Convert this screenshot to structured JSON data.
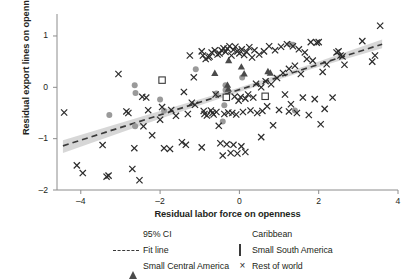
{
  "chart_data": {
    "type": "scatter",
    "title": "",
    "xlabel": "Residual labor force on openness",
    "ylabel": "Residual export lines on openness",
    "xlim": [
      -4.6,
      4.0
    ],
    "ylim": [
      -2.0,
      1.35
    ],
    "xticks": [
      -4,
      -2,
      0,
      2,
      4
    ],
    "xtick_labels": [
      "–4",
      "–2",
      "0",
      "2",
      "4"
    ],
    "yticks": [
      1,
      0,
      -1,
      -2
    ],
    "ytick_labels": [
      "1",
      "0",
      "–1",
      "–2"
    ],
    "grid": false,
    "legend_position": "below",
    "legend": [
      {
        "key": "ci",
        "label": "95% CI",
        "marker": "shaded-band",
        "color": "#c9c9c9"
      },
      {
        "key": "caribbean",
        "label": "Caribbean",
        "marker": "filled-circle",
        "color": "#9a9a9a"
      },
      {
        "key": "fit",
        "label": "Fit line",
        "marker": "dashed-line",
        "color": "#3a3a3a"
      },
      {
        "key": "small_south_america",
        "label": "Small South America",
        "marker": "open-square",
        "color": "#3a3a3a"
      },
      {
        "key": "small_central_america",
        "label": "Small Central America",
        "marker": "filled-triangle",
        "color": "#4a4a4a"
      },
      {
        "key": "rest_of_world",
        "label": "Rest of world",
        "marker": "cross-x",
        "color": "#2b2b2b"
      }
    ],
    "fit_line": {
      "name": "Fit line",
      "style": "dashed",
      "color": "#3a3a3a",
      "slope": 0.2455,
      "intercept": -0.0455,
      "x_start": -4.45,
      "x_end": 3.6,
      "y_start": -1.14,
      "y_end": 0.84
    },
    "confidence_band": {
      "name": "95% CI",
      "level": 0.95,
      "color": "#c9c9c9",
      "upper": [
        [
          -4.45,
          -1.03
        ],
        [
          -2.0,
          -0.46
        ],
        [
          0.0,
          -0.005
        ],
        [
          1.8,
          0.45
        ],
        [
          3.6,
          0.93
        ]
      ],
      "lower": [
        [
          -4.45,
          -1.28
        ],
        [
          -2.0,
          -0.61
        ],
        [
          0.0,
          -0.09
        ],
        [
          1.8,
          0.35
        ],
        [
          3.6,
          0.76
        ]
      ]
    },
    "series": [
      {
        "name": "Caribbean",
        "marker": "filled-circle",
        "color": "#9a9a9a",
        "points": [
          [
            -3.28,
            -0.54
          ],
          [
            -2.64,
            0.04
          ],
          [
            -2.62,
            -0.11
          ],
          [
            -2.63,
            -0.76
          ],
          [
            -2.0,
            -0.235
          ],
          [
            -1.9,
            -0.455
          ],
          [
            -1.1,
            0.35
          ],
          [
            -0.58,
            -0.12
          ],
          [
            -0.35,
            0.04
          ],
          [
            -0.35,
            -0.05
          ],
          [
            -0.38,
            -0.35
          ],
          [
            -0.42,
            -0.665
          ],
          [
            0.07,
            0.19
          ],
          [
            1.27,
            0.84
          ],
          [
            1.35,
            0.83
          ],
          [
            1.4,
            -0.45
          ]
        ]
      },
      {
        "name": "Small South America",
        "marker": "open-square",
        "color": "#3a3a3a",
        "points": [
          [
            -1.95,
            0.14
          ],
          [
            -0.33,
            -0.195
          ],
          [
            0.65,
            -0.175
          ]
        ]
      },
      {
        "name": "Small Central America",
        "marker": "filled-triangle",
        "color": "#4a4a4a",
        "points": [
          [
            -0.62,
            0.275
          ],
          [
            -0.27,
            0.525
          ],
          [
            -0.3,
            0.045
          ],
          [
            -0.28,
            -0.03
          ],
          [
            0.05,
            0.4
          ],
          [
            0.12,
            0.265
          ],
          [
            0.72,
            0.31
          ],
          [
            0.78,
            0.28
          ]
        ]
      },
      {
        "name": "Rest of world",
        "marker": "cross-x",
        "color": "#2b2b2b",
        "points": [
          [
            -4.42,
            -0.49
          ],
          [
            -4.1,
            -1.52
          ],
          [
            -3.95,
            -1.67
          ],
          [
            -3.45,
            -1.125
          ],
          [
            -3.35,
            -1.74
          ],
          [
            -3.3,
            -1.72
          ],
          [
            -3.05,
            0.26
          ],
          [
            -2.85,
            -0.47
          ],
          [
            -2.8,
            -0.5
          ],
          [
            -2.7,
            -1.59
          ],
          [
            -2.65,
            -1.185
          ],
          [
            -2.52,
            -1.81
          ],
          [
            -2.45,
            -0.185
          ],
          [
            -2.42,
            -0.76
          ],
          [
            -2.3,
            -0.445
          ],
          [
            -2.2,
            -0.935
          ],
          [
            -1.95,
            -0.385
          ],
          [
            -1.9,
            -1.185
          ],
          [
            -1.75,
            -1.2
          ],
          [
            -1.72,
            -0.44
          ],
          [
            -1.6,
            -0.555
          ],
          [
            -1.45,
            -1.07
          ],
          [
            -1.4,
            -0.09
          ],
          [
            -1.35,
            -1.12
          ],
          [
            -1.25,
            0.62
          ],
          [
            -1.2,
            -0.3
          ],
          [
            -1.15,
            0.195
          ],
          [
            -1.12,
            -0.34
          ],
          [
            -0.95,
            0.7
          ],
          [
            -0.92,
            0.62
          ],
          [
            -0.9,
            -0.46
          ],
          [
            -0.88,
            -0.52
          ],
          [
            -0.85,
            0.55
          ],
          [
            -0.82,
            -0.55
          ],
          [
            -0.78,
            0.58
          ],
          [
            -0.75,
            0.6
          ],
          [
            -0.72,
            -0.45
          ],
          [
            -0.7,
            0.68
          ],
          [
            -0.68,
            -0.5
          ],
          [
            -0.65,
            -0.53
          ],
          [
            -0.62,
            0.72
          ],
          [
            -0.6,
            -0.14
          ],
          [
            -0.58,
            -0.48
          ],
          [
            -0.55,
            0.64
          ],
          [
            -0.52,
            -0.75
          ],
          [
            -0.5,
            0.66
          ],
          [
            -0.48,
            -1.09
          ],
          [
            -0.45,
            0.72
          ],
          [
            -0.42,
            -1.33
          ],
          [
            -0.4,
            0.76
          ],
          [
            -0.38,
            -0.52
          ],
          [
            -0.35,
            0.69
          ],
          [
            -0.32,
            -1.11
          ],
          [
            -0.3,
            0.75
          ],
          [
            -0.28,
            -0.49
          ],
          [
            -0.25,
            0.8
          ],
          [
            -0.22,
            -1.28
          ],
          [
            -0.2,
            0.62
          ],
          [
            -0.18,
            -0.5
          ],
          [
            -0.15,
            0.73
          ],
          [
            -0.12,
            -0.18
          ],
          [
            -0.1,
            0.79
          ],
          [
            -0.08,
            -0.53
          ],
          [
            -0.05,
            0.7
          ],
          [
            -0.02,
            -0.26
          ],
          [
            0.0,
            0.66
          ],
          [
            0.03,
            -0.19
          ],
          [
            0.06,
            0.74
          ],
          [
            0.09,
            -0.48
          ],
          [
            0.12,
            0.63
          ],
          [
            0.15,
            -0.22
          ],
          [
            0.18,
            0.69
          ],
          [
            0.22,
            -0.14
          ],
          [
            0.25,
            0.78
          ],
          [
            0.28,
            -0.45
          ],
          [
            0.32,
            0.58
          ],
          [
            0.35,
            -0.2
          ],
          [
            0.38,
            0.72
          ],
          [
            0.42,
            0.07
          ],
          [
            0.45,
            -0.5
          ],
          [
            0.5,
            0.64
          ],
          [
            0.55,
            0.0
          ],
          [
            0.58,
            -0.46
          ],
          [
            0.62,
            0.7
          ],
          [
            0.66,
            0.12
          ],
          [
            0.7,
            -0.37
          ],
          [
            0.75,
            0.8
          ],
          [
            0.8,
            0.06
          ],
          [
            0.85,
            -0.74
          ],
          [
            0.9,
            0.72
          ],
          [
            0.95,
            0.18
          ],
          [
            1.0,
            -0.44
          ],
          [
            1.05,
            0.79
          ],
          [
            1.1,
            0.28
          ],
          [
            1.15,
            -0.14
          ],
          [
            1.2,
            0.84
          ],
          [
            1.25,
            0.36
          ],
          [
            1.3,
            -0.33
          ],
          [
            1.35,
            0.8
          ],
          [
            1.4,
            0.42
          ],
          [
            1.45,
            -0.5
          ],
          [
            1.5,
            0.74
          ],
          [
            1.55,
            0.26
          ],
          [
            1.6,
            -0.2
          ],
          [
            1.65,
            0.68
          ],
          [
            1.7,
            0.55
          ],
          [
            1.75,
            -0.54
          ],
          [
            1.8,
            0.88
          ],
          [
            1.85,
            0.52
          ],
          [
            1.9,
            -0.23
          ],
          [
            1.95,
            0.87
          ],
          [
            2.0,
            0.88
          ],
          [
            2.05,
            -0.72
          ],
          [
            2.1,
            0.3
          ],
          [
            2.15,
            -0.42
          ],
          [
            2.2,
            0.45
          ],
          [
            2.35,
            -0.2
          ],
          [
            2.45,
            0.68
          ],
          [
            2.5,
            0.7
          ],
          [
            2.55,
            0.62
          ],
          [
            2.6,
            0.6
          ],
          [
            2.65,
            0.44
          ],
          [
            3.1,
            0.9
          ],
          [
            3.35,
            0.5
          ],
          [
            3.42,
            0.62
          ],
          [
            3.55,
            1.2
          ],
          [
            0.55,
            -0.97
          ],
          [
            -0.15,
            -1.12
          ],
          [
            0.05,
            -1.15
          ],
          [
            -0.05,
            -1.29
          ],
          [
            0.15,
            -1.26
          ],
          [
            -2.0,
            -0.63
          ],
          [
            -1.3,
            -0.52
          ],
          [
            -0.95,
            -1.17
          ],
          [
            -2.35,
            -0.2
          ],
          [
            1.25,
            -0.47
          ]
        ]
      }
    ]
  },
  "axes": {
    "ytick_labels": [
      "1",
      "0",
      "–1",
      "–2"
    ],
    "xtick_labels": [
      "–4",
      "–2",
      "0",
      "2",
      "4"
    ],
    "xlabel": "Residual labor force on openness",
    "ylabel": "Residual export lines on openness"
  },
  "legend": {
    "ci": "95% CI",
    "caribbean": "Caribbean",
    "fit": "Fit line",
    "small_south_america": "Small South America",
    "small_central_america": "Small Central America",
    "rest_of_world": "Rest of world"
  }
}
